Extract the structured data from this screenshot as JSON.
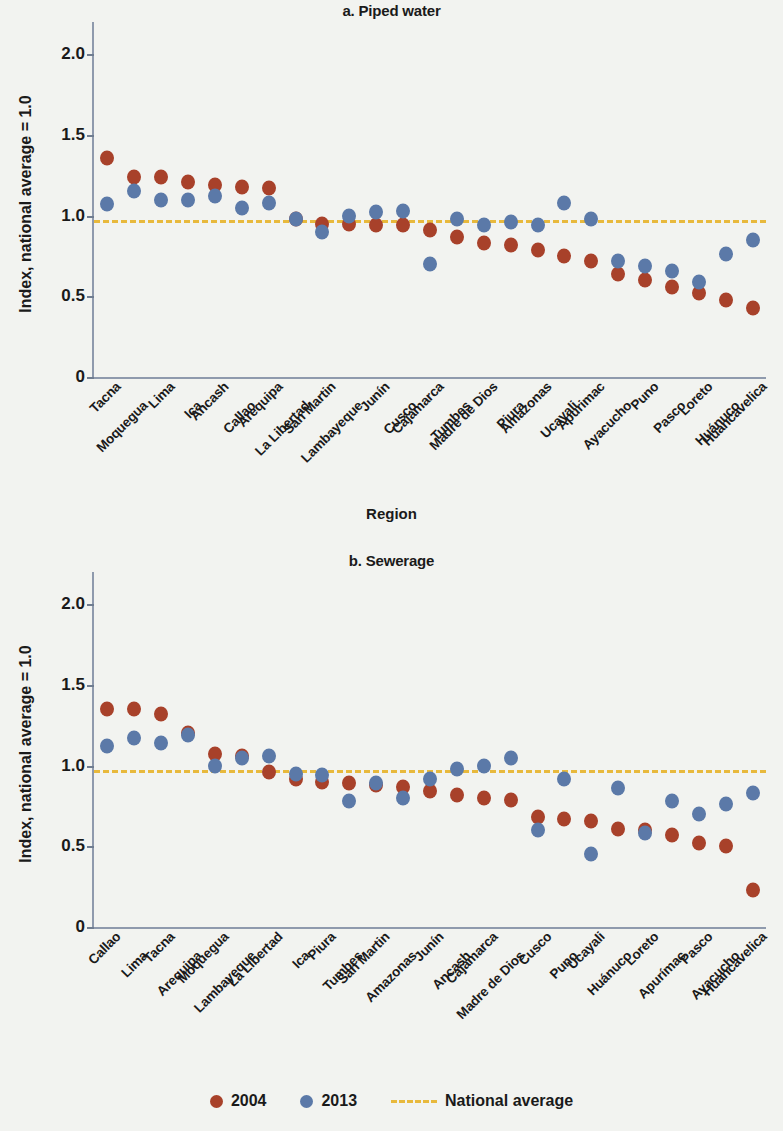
{
  "figure": {
    "legend": {
      "items": [
        {
          "label": "2004",
          "type": "dot",
          "color": "#a8412a"
        },
        {
          "label": "2013",
          "type": "dot",
          "color": "#5b79a8"
        },
        {
          "label": "National average",
          "type": "dashed-line",
          "color": "#e8b93c"
        }
      ]
    },
    "background_color": "#f2f3f0"
  },
  "chart_data": [
    {
      "type": "scatter",
      "panel": "a",
      "title": "a. Piped water",
      "xlabel": "Region",
      "ylabel": "Index, national average = 1.0",
      "ylim": [
        0,
        2.2
      ],
      "yticks": [
        "0",
        "0.5",
        "1.0",
        "1.5",
        "2.0"
      ],
      "ytick_values": [
        0,
        0.5,
        1.0,
        1.5,
        2.0
      ],
      "grid": false,
      "legend_position": "bottom",
      "reference_line": {
        "label": "National average",
        "value": 0.97,
        "color": "#e8b93c",
        "style": "dashed"
      },
      "categories": [
        "Tacna",
        "Moquegua",
        "Lima",
        "Ica",
        "Ancash",
        "Callao",
        "Arequipa",
        "La Libertad",
        "San Martin",
        "Lambayeque",
        "Junín",
        "Cusco",
        "Cajamarca",
        "Tumbes",
        "Madre de Dios",
        "Piura",
        "Amazonas",
        "Ucayali",
        "Apurimac",
        "Ayacucho",
        "Puno",
        "Pasco",
        "Loreto",
        "Huánuco",
        "Huancavelica"
      ],
      "series": [
        {
          "name": "2004",
          "color": "#a8412a",
          "values": [
            1.36,
            1.24,
            1.24,
            1.21,
            1.19,
            1.18,
            1.17,
            0.98,
            0.95,
            0.95,
            0.94,
            0.94,
            0.91,
            0.87,
            0.83,
            0.82,
            0.79,
            0.75,
            0.72,
            0.64,
            0.6,
            0.56,
            0.52,
            0.48,
            0.43
          ]
        },
        {
          "name": "2013",
          "color": "#5b79a8",
          "values": [
            1.07,
            1.15,
            1.1,
            1.1,
            1.12,
            1.05,
            1.08,
            0.98,
            0.9,
            1.0,
            1.02,
            1.03,
            0.7,
            0.98,
            0.94,
            0.96,
            0.94,
            1.08,
            0.98,
            0.72,
            0.69,
            0.66,
            0.59,
            0.76,
            0.85
          ]
        }
      ]
    },
    {
      "type": "scatter",
      "panel": "b",
      "title": "b. Sewerage",
      "xlabel": "Region",
      "ylabel": "Index, national average = 1.0",
      "ylim": [
        0,
        2.2
      ],
      "yticks": [
        "0",
        "0.5",
        "1.0",
        "1.5",
        "2.0"
      ],
      "ytick_values": [
        0,
        0.5,
        1.0,
        1.5,
        2.0
      ],
      "grid": false,
      "legend_position": "bottom",
      "reference_line": {
        "label": "National average",
        "value": 0.97,
        "color": "#e8b93c",
        "style": "dashed"
      },
      "categories": [
        "Callao",
        "Lima",
        "Tacna",
        "Arequipa",
        "Moquegua",
        "Lambayeque",
        "La Libertad",
        "Ica",
        "Piura",
        "Tumbes",
        "San Martin",
        "Amazonas",
        "Junín",
        "Ancash",
        "Cajamarca",
        "Madre de Dios",
        "Cusco",
        "Puno",
        "Ucayali",
        "Huánuco",
        "Loreto",
        "Apurímac",
        "Pasco",
        "Ayacucho",
        "Huancavelica"
      ],
      "series": [
        {
          "name": "2004",
          "color": "#a8412a",
          "values": [
            1.35,
            1.35,
            1.32,
            1.2,
            1.07,
            1.06,
            0.96,
            0.92,
            0.9,
            0.89,
            0.88,
            0.87,
            0.84,
            0.82,
            0.8,
            0.79,
            0.68,
            0.67,
            0.66,
            0.61,
            0.6,
            0.57,
            0.52,
            0.5,
            0.23
          ]
        },
        {
          "name": "2013",
          "color": "#5b79a8",
          "values": [
            1.12,
            1.17,
            1.14,
            1.19,
            1.0,
            1.05,
            1.06,
            0.95,
            0.94,
            0.78,
            0.89,
            0.8,
            0.92,
            0.98,
            1.0,
            1.05,
            0.6,
            0.92,
            0.45,
            0.86,
            0.58,
            0.78,
            0.7,
            0.76,
            0.83
          ]
        }
      ]
    }
  ]
}
